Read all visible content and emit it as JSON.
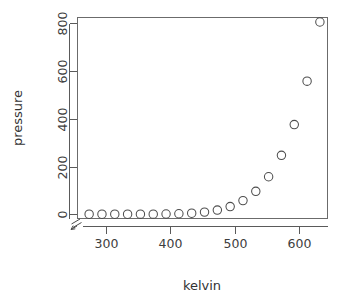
{
  "chart_data": {
    "type": "scatter",
    "title": "",
    "xlabel": "kelvin",
    "ylabel": "pressure",
    "xlim": [
      255,
      645
    ],
    "ylim": [
      -18,
      825
    ],
    "grid": false,
    "legend": "none",
    "marker": "open-circle",
    "marker_size": 4.2,
    "axis_break": true,
    "xticks": [
      300,
      400,
      500,
      600
    ],
    "xtick_labels": [
      "300",
      "400",
      "500",
      "600"
    ],
    "yticks": [
      0,
      200,
      400,
      600,
      800
    ],
    "ytick_labels": [
      "0",
      "200",
      "400",
      "600",
      "800"
    ],
    "x": [
      273.15,
      293.15,
      313.15,
      333.15,
      353.15,
      373.15,
      393.15,
      413.15,
      433.15,
      453.15,
      473.15,
      493.15,
      513.15,
      533.15,
      553.15,
      573.15,
      593.15,
      613.15,
      633.15
    ],
    "y": [
      0.0002,
      0.0012,
      0.006,
      0.03,
      0.09,
      0.27,
      0.75,
      1.85,
      4.2,
      8.8,
      17.3,
      32.1,
      57.0,
      96.0,
      157.0,
      247.0,
      376.0,
      558.0,
      806.0
    ],
    "points": [
      {
        "x": 273.15,
        "y": 0.0002
      },
      {
        "x": 293.15,
        "y": 0.0012
      },
      {
        "x": 313.15,
        "y": 0.006
      },
      {
        "x": 333.15,
        "y": 0.03
      },
      {
        "x": 353.15,
        "y": 0.09
      },
      {
        "x": 373.15,
        "y": 0.27
      },
      {
        "x": 393.15,
        "y": 0.75
      },
      {
        "x": 413.15,
        "y": 1.85
      },
      {
        "x": 433.15,
        "y": 4.2
      },
      {
        "x": 453.15,
        "y": 8.8
      },
      {
        "x": 473.15,
        "y": 17.3
      },
      {
        "x": 493.15,
        "y": 32.1
      },
      {
        "x": 513.15,
        "y": 57.0
      },
      {
        "x": 533.15,
        "y": 96.0
      },
      {
        "x": 553.15,
        "y": 157.0
      },
      {
        "x": 573.15,
        "y": 247.0
      },
      {
        "x": 593.15,
        "y": 376.0
      },
      {
        "x": 613.15,
        "y": 558.0
      },
      {
        "x": 633.15,
        "y": 806.0
      }
    ],
    "colors": {
      "marker_stroke": "#4d4d4d",
      "axis": "#5a5a5a",
      "box": "#6b6b6b",
      "text": "#3d3d3d",
      "background": "#ffffff"
    }
  }
}
